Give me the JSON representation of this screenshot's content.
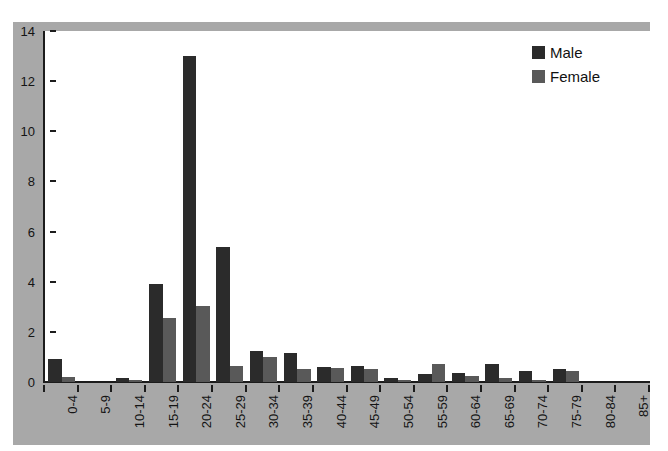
{
  "chart_data": {
    "type": "bar",
    "title": "",
    "subtitle": "",
    "xlabel": "",
    "ylabel": "",
    "ylim": [
      0,
      14
    ],
    "yticks": [
      0,
      2,
      4,
      6,
      8,
      10,
      12,
      14
    ],
    "ytick_labels": [
      "0",
      "2",
      "4",
      "6",
      "8",
      "10",
      "12",
      "14"
    ],
    "grid": false,
    "legend_position": "top-right",
    "categories": [
      "0-4",
      "5-9",
      "10-14",
      "15-19",
      "20-24",
      "25-29",
      "30-34",
      "35-39",
      "40-44",
      "45-49",
      "50-54",
      "55-59",
      "60-64",
      "65-69",
      "70-74",
      "75-79",
      "80-84",
      "85+"
    ],
    "series": [
      {
        "name": "Male",
        "color": "#2b2b2b",
        "values": [
          0.9,
          0.0,
          0.15,
          3.9,
          13.0,
          5.4,
          1.25,
          1.15,
          0.6,
          0.65,
          0.15,
          0.3,
          0.35,
          0.7,
          0.45,
          0.5,
          0.0,
          0.0
        ]
      },
      {
        "name": "Female",
        "color": "#595959",
        "values": [
          0.2,
          0.0,
          0.1,
          2.55,
          3.05,
          0.65,
          1.0,
          0.5,
          0.55,
          0.5,
          0.1,
          0.7,
          0.25,
          0.15,
          0.1,
          0.45,
          0.0,
          0.0
        ]
      }
    ]
  },
  "legend": {
    "items": [
      {
        "label": "Male",
        "swatch": "male"
      },
      {
        "label": "Female",
        "swatch": "female"
      }
    ]
  },
  "colors": {
    "panel_background": "#a8a8a8",
    "plot_background": "#ffffff",
    "axis": "#1c1c1c",
    "male": "#2b2b2b",
    "female": "#595959"
  }
}
